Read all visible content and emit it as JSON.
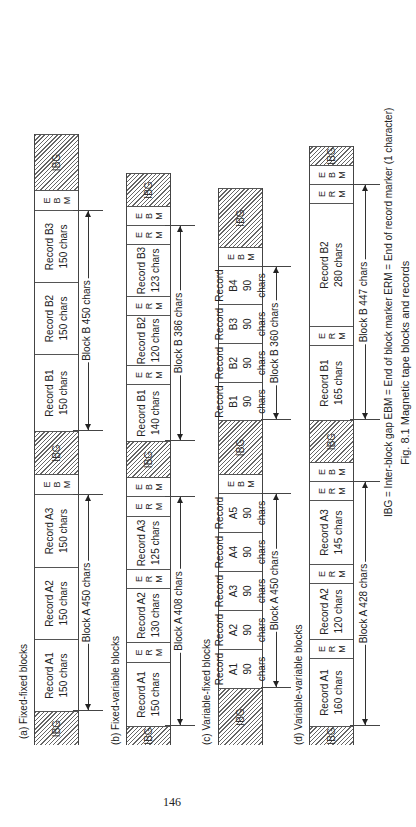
{
  "page_number": "146",
  "figure": {
    "caption": "Fig. 8.1 Magnetic tape blocks and records",
    "legend": "IBG = Inter-block gap   EBM = End of block marker   ERM = End of record marker (1 character)"
  },
  "sections": [
    {
      "label": "(a) Fixed-fixed blocks",
      "cells": [
        {
          "type": "ibg",
          "text": "IBG",
          "x": 0,
          "w": 34
        },
        {
          "type": "rec",
          "l1": "Record A1",
          "l2": "150 chars",
          "x": 34,
          "w": 72
        },
        {
          "type": "rec",
          "l1": "Record A2",
          "l2": "150 chars",
          "x": 106,
          "w": 72
        },
        {
          "type": "rec",
          "l1": "Record A3",
          "l2": "150 chars",
          "x": 178,
          "w": 73
        },
        {
          "type": "mk",
          "text": "E B M",
          "x": 251,
          "w": 20
        },
        {
          "type": "ibg",
          "text": "IBG",
          "x": 271,
          "w": 43
        },
        {
          "type": "rec",
          "l1": "Record B1",
          "l2": "150 chars",
          "x": 314,
          "w": 77
        },
        {
          "type": "rec",
          "l1": "Record B2",
          "l2": "150 chars",
          "x": 391,
          "w": 72
        },
        {
          "type": "rec",
          "l1": "Record B3",
          "l2": "150 chars",
          "x": 463,
          "w": 72
        },
        {
          "type": "mk",
          "text": "E B M",
          "x": 535,
          "w": 20
        },
        {
          "type": "ibg",
          "text": "IBG",
          "x": 555,
          "w": 56
        }
      ],
      "blocks": [
        {
          "label": "Block A 450 chars",
          "x": 34,
          "w": 217
        },
        {
          "label": "Block B 450 chars",
          "x": 314,
          "w": 221
        }
      ]
    },
    {
      "label": "(b) Fixed-variable blocks",
      "cells": [
        {
          "type": "ibg",
          "text": "IBG",
          "x": 0,
          "w": 19
        },
        {
          "type": "rec",
          "l1": "Record A1",
          "l2": "150 chars",
          "x": 19,
          "w": 64
        },
        {
          "type": "mk",
          "text": "E R M",
          "x": 83,
          "w": 20
        },
        {
          "type": "rec",
          "l1": "Record A2",
          "l2": "130 chars",
          "x": 103,
          "w": 54
        },
        {
          "type": "mk",
          "text": "E R M",
          "x": 157,
          "w": 19
        },
        {
          "type": "rec",
          "l1": "Record A3",
          "l2": "125 chars",
          "x": 176,
          "w": 53
        },
        {
          "type": "mk",
          "text": "E R M",
          "x": 229,
          "w": 20
        },
        {
          "type": "mk",
          "text": "E B M",
          "x": 249,
          "w": 19
        },
        {
          "type": "ibg",
          "text": "IBG",
          "x": 268,
          "w": 36
        },
        {
          "type": "rec",
          "l1": "Record B1",
          "l2": "140 chars",
          "x": 304,
          "w": 57
        },
        {
          "type": "mk",
          "text": "E R M",
          "x": 361,
          "w": 19
        },
        {
          "type": "rec",
          "l1": "Record B2",
          "l2": "120 chars",
          "x": 380,
          "w": 50
        },
        {
          "type": "mk",
          "text": "E R M",
          "x": 430,
          "w": 19
        },
        {
          "type": "rec",
          "l1": "Record B3",
          "l2": "123 chars",
          "x": 449,
          "w": 52
        },
        {
          "type": "mk",
          "text": "E R M",
          "x": 501,
          "w": 19
        },
        {
          "type": "mk",
          "text": "E B M",
          "x": 520,
          "w": 19
        },
        {
          "type": "ibg",
          "text": "IBG",
          "x": 539,
          "w": 33
        }
      ],
      "blocks": [
        {
          "label": "Block A 408 chars",
          "x": 19,
          "w": 230
        },
        {
          "label": "Block B 386 chars",
          "x": 304,
          "w": 216
        }
      ]
    },
    {
      "label": "(c) Variable-fixed blocks",
      "cells": [
        {
          "type": "ibg",
          "text": "IBG",
          "x": 0,
          "w": 57
        },
        {
          "type": "rec",
          "l1": "Record",
          "l2": "A1",
          "l3": "90 chars",
          "x": 57,
          "w": 39
        },
        {
          "type": "rec",
          "l1": "Record",
          "l2": "A2",
          "l3": "90 chars",
          "x": 96,
          "w": 39
        },
        {
          "type": "rec",
          "l1": "Record",
          "l2": "A3",
          "l3": "90 chars",
          "x": 135,
          "w": 39
        },
        {
          "type": "rec",
          "l1": "Record",
          "l2": "A4",
          "l3": "90 chars",
          "x": 174,
          "w": 39
        },
        {
          "type": "rec",
          "l1": "Record",
          "l2": "A5",
          "l3": "90 chars",
          "x": 213,
          "w": 39
        },
        {
          "type": "mk",
          "text": "E B M",
          "x": 252,
          "w": 19
        },
        {
          "type": "ibg",
          "text": "IBG",
          "x": 271,
          "w": 54
        },
        {
          "type": "rec",
          "l1": "Record",
          "l2": "B1",
          "l3": "90 chars",
          "x": 325,
          "w": 38
        },
        {
          "type": "rec",
          "l1": "Record",
          "l2": "B2",
          "l3": "90 chars",
          "x": 363,
          "w": 39
        },
        {
          "type": "rec",
          "l1": "Record",
          "l2": "B3",
          "l3": "90 chars",
          "x": 402,
          "w": 39
        },
        {
          "type": "rec",
          "l1": "Record",
          "l2": "B4",
          "l3": "90 chars",
          "x": 441,
          "w": 38
        },
        {
          "type": "mk",
          "text": "E B M",
          "x": 479,
          "w": 19
        },
        {
          "type": "ibg",
          "text": "IBG",
          "x": 498,
          "w": 59
        }
      ],
      "blocks": [
        {
          "label": "Block A 450 chars",
          "x": 57,
          "w": 195
        },
        {
          "label": "Block B 360 chars",
          "x": 325,
          "w": 154
        }
      ]
    },
    {
      "label": "(d) Variable-variable blocks",
      "cells": [
        {
          "type": "ibg",
          "text": "IBG",
          "x": 0,
          "w": 19
        },
        {
          "type": "rec",
          "l1": "Record A1",
          "l2": "160 chars",
          "x": 19,
          "w": 68
        },
        {
          "type": "mk",
          "text": "E R M",
          "x": 87,
          "w": 19
        },
        {
          "type": "rec",
          "l1": "Record A2",
          "l2": "120 chars",
          "x": 106,
          "w": 56
        },
        {
          "type": "mk",
          "text": "E R M",
          "x": 162,
          "w": 19
        },
        {
          "type": "rec",
          "l1": "Record A3",
          "l2": "145 chars",
          "x": 181,
          "w": 64
        },
        {
          "type": "mk",
          "text": "E R M",
          "x": 245,
          "w": 19
        },
        {
          "type": "mk",
          "text": "E B M",
          "x": 264,
          "w": 19
        },
        {
          "type": "ibg",
          "text": "IBG",
          "x": 283,
          "w": 42
        },
        {
          "type": "rec",
          "l1": "Record B1",
          "l2": "165 chars",
          "x": 325,
          "w": 75
        },
        {
          "type": "mk",
          "text": "E R M",
          "x": 400,
          "w": 19
        },
        {
          "type": "rec",
          "l1": "Record B2",
          "l2": "280 chars",
          "x": 419,
          "w": 123
        },
        {
          "type": "mk",
          "text": "E R M",
          "x": 542,
          "w": 19
        },
        {
          "type": "mk",
          "text": "E B M",
          "x": 561,
          "w": 19
        },
        {
          "type": "ibg",
          "text": "IBG",
          "x": 580,
          "w": 19
        }
      ],
      "blocks": [
        {
          "label": "Block A 428 chars",
          "x": 19,
          "w": 245
        },
        {
          "label": "Block B 447 chars",
          "x": 325,
          "w": 236
        }
      ]
    }
  ]
}
